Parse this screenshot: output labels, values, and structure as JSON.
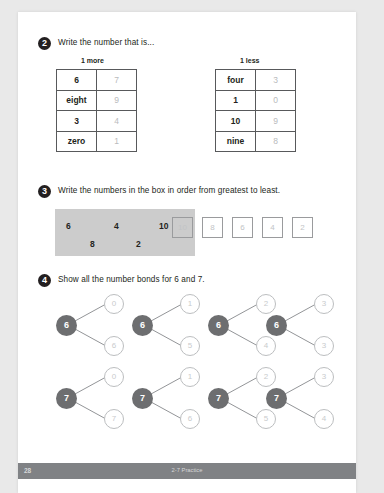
{
  "page": {
    "footer": {
      "page_number": "28",
      "center_label": "2-7 Practice"
    }
  },
  "question2": {
    "number": "2",
    "prompt": "Write the number that is...",
    "left_table": {
      "caption": "1 more",
      "rows": [
        {
          "given": "6",
          "answer": "7"
        },
        {
          "given": "eight",
          "answer": "9"
        },
        {
          "given": "3",
          "answer": "4"
        },
        {
          "given": "zero",
          "answer": "1"
        }
      ]
    },
    "right_table": {
      "caption": "1 less",
      "rows": [
        {
          "given": "four",
          "answer": "3"
        },
        {
          "given": "1",
          "answer": "0"
        },
        {
          "given": "10",
          "answer": "9"
        },
        {
          "given": "nine",
          "answer": "8"
        }
      ]
    }
  },
  "question3": {
    "number": "3",
    "prompt": "Write the numbers in the box in order from greatest to least.",
    "box_numbers": [
      "6",
      "4",
      "10",
      "8",
      "2"
    ],
    "answer_boxes": [
      "10",
      "8",
      "6",
      "4",
      "2"
    ]
  },
  "question4": {
    "number": "4",
    "prompt": "Show all the number bonds for 6 and 7.",
    "bonds": [
      {
        "whole": "6",
        "top": "0",
        "bottom": "6"
      },
      {
        "whole": "6",
        "top": "1",
        "bottom": "5"
      },
      {
        "whole": "6",
        "top": "2",
        "bottom": "4"
      },
      {
        "whole": "6",
        "top": "3",
        "bottom": "3"
      },
      {
        "whole": "7",
        "top": "0",
        "bottom": "7"
      },
      {
        "whole": "7",
        "top": "1",
        "bottom": "6"
      },
      {
        "whole": "7",
        "top": "2",
        "bottom": "5"
      },
      {
        "whole": "7",
        "top": "3",
        "bottom": "4"
      }
    ]
  }
}
